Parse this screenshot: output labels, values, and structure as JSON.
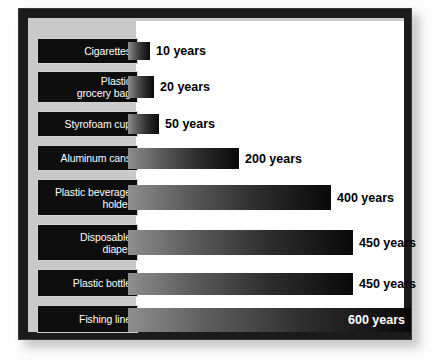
{
  "chart_data": {
    "type": "bar",
    "orientation": "horizontal",
    "title": "",
    "subtitle": "",
    "xlabel": "",
    "ylabel": "",
    "xlim": [
      0,
      600
    ],
    "grid": false,
    "legend": null,
    "value_suffix": "years",
    "categories": [
      "Cigarettes",
      "Plastic\ngrocery bag",
      "Styrofoam cup",
      "Aluminum cans",
      "Plastic beverage\nholder",
      "Disposable\ndiaper",
      "Plastic bottle",
      "Fishing line"
    ],
    "values": [
      10,
      20,
      50,
      200,
      400,
      450,
      450,
      600
    ],
    "value_labels": [
      "10 years",
      "20 years",
      "50 years",
      "200 years",
      "400 years",
      "450 years",
      "450 years",
      "600 years"
    ]
  },
  "chart": {
    "rows": [
      {
        "label": "Cigarettes",
        "value": 10,
        "value_label": "10 years",
        "label_top": 20,
        "label_height": 26,
        "bar_top": 24,
        "bar_height": 18,
        "bar_width": 22,
        "label_inside": false
      },
      {
        "label": "Plastic\ngrocery bag",
        "value": 20,
        "value_label": "20 years",
        "label_top": 53,
        "label_height": 32,
        "bar_top": 58,
        "bar_height": 22,
        "bar_width": 26,
        "label_inside": false
      },
      {
        "label": "Styrofoam cup",
        "value": 50,
        "value_label": "50 years",
        "label_top": 93,
        "label_height": 26,
        "bar_top": 96,
        "bar_height": 20,
        "bar_width": 31,
        "label_inside": false
      },
      {
        "label": "Aluminum cans",
        "value": 200,
        "value_label": "200 years",
        "label_top": 127,
        "label_height": 26,
        "bar_top": 130,
        "bar_height": 21,
        "bar_width": 111,
        "label_inside": false
      },
      {
        "label": "Plastic beverage\nholder",
        "value": 400,
        "value_label": "400 years",
        "label_top": 161,
        "label_height": 37,
        "bar_top": 167,
        "bar_height": 25,
        "bar_width": 203,
        "label_inside": false
      },
      {
        "label": "Disposable\ndiaper",
        "value": 450,
        "value_label": "450 years",
        "label_top": 206,
        "label_height": 37,
        "bar_top": 212,
        "bar_height": 25,
        "bar_width": 225,
        "label_inside": false
      },
      {
        "label": "Plastic bottle",
        "value": 450,
        "value_label": "450 years",
        "label_top": 251,
        "label_height": 28,
        "bar_top": 255,
        "bar_height": 22,
        "bar_width": 225,
        "label_inside": false
      },
      {
        "label": "Fishing line",
        "value": 600,
        "value_label": "600 years",
        "label_top": 287,
        "label_height": 28,
        "bar_top": 290,
        "bar_height": 24,
        "bar_width": 283,
        "label_inside": true
      }
    ]
  },
  "colors": {
    "frame": "#1b1b1b",
    "panel": "#c9c9c9",
    "plot_background": "#ffffff",
    "label_box": "#0d0d0d",
    "label_border": "#d2d2d2",
    "label_text": "#ffffff",
    "value_text": "#000000",
    "value_text_inside": "#ffffff",
    "bar_gradient_start": "#8e8e8e",
    "bar_gradient_end": "#090909",
    "page_background": "#fdfdfd"
  }
}
